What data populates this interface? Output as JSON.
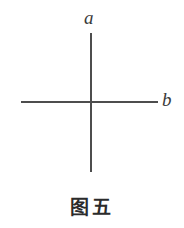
{
  "figure": {
    "caption": "图五",
    "background_color": "#ffffff",
    "line_color": "#4d4d4d",
    "text_color": "#2b2b2b",
    "labels": {
      "vertical_line": "a",
      "horizontal_line": "b"
    }
  },
  "chart_data": {
    "type": "line",
    "title": "图五",
    "xlabel": "",
    "ylabel": "",
    "series": [
      {
        "name": "a",
        "label": "a",
        "orientation": "vertical",
        "x": [
          91,
          91
        ],
        "y": [
          33,
          172
        ]
      },
      {
        "name": "b",
        "label": "b",
        "orientation": "horizontal",
        "x": [
          21,
          158
        ],
        "y": [
          102,
          102
        ]
      }
    ],
    "intersection": [
      91,
      102
    ],
    "grid": false,
    "legend": "none"
  }
}
